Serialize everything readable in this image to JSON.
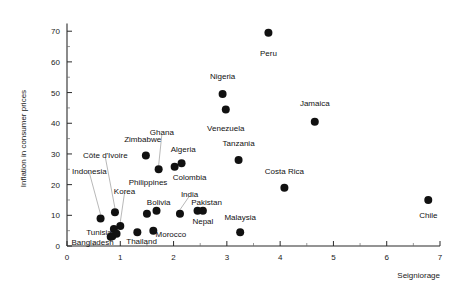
{
  "chart_data": {
    "type": "scatter",
    "title": "",
    "xlabel": "Seigniorage",
    "ylabel": "Inflation in consumer prices",
    "xlim": [
      0,
      7
    ],
    "ylim": [
      0,
      73
    ],
    "grid": false,
    "legend": "none",
    "xticks": [
      0,
      1,
      2,
      3,
      4,
      5,
      6,
      7
    ],
    "xtick_labels": [
      "0",
      "1",
      "2",
      "3",
      "4",
      "5",
      "6",
      "7"
    ],
    "yticks": [
      0,
      10,
      20,
      30,
      40,
      50,
      60,
      70
    ],
    "ytick_labels": [
      "0",
      "10",
      "20",
      "30",
      "40",
      "50",
      "60",
      "70"
    ],
    "marker": "filled-circle",
    "marker_color": "#111111",
    "points": [
      {
        "label": "Peru",
        "x": 3.78,
        "y": 69.5,
        "lx": 3.78,
        "ly": 63.0,
        "anchor": "middle",
        "leader": false
      },
      {
        "label": "Nigeria",
        "x": 2.92,
        "y": 49.5,
        "lx": 2.92,
        "ly": 55.5,
        "anchor": "middle",
        "leader": false
      },
      {
        "label": "Venezuela",
        "x": 2.98,
        "y": 44.5,
        "lx": 2.98,
        "ly": 38.5,
        "anchor": "middle",
        "leader": false
      },
      {
        "label": "Jamaica",
        "x": 4.65,
        "y": 40.5,
        "lx": 4.65,
        "ly": 46.5,
        "anchor": "middle",
        "leader": false
      },
      {
        "label": "Zimbabwe",
        "x": 1.48,
        "y": 29.5,
        "lx": 1.42,
        "ly": 35.0,
        "anchor": "middle",
        "leader": false
      },
      {
        "label": "Ghana",
        "x": 1.72,
        "y": 25.0,
        "lx": 1.78,
        "ly": 37.0,
        "anchor": "middle",
        "leader": true
      },
      {
        "label": "Algeria",
        "x": 2.02,
        "y": 25.8,
        "lx": 2.18,
        "ly": 31.5,
        "anchor": "middle",
        "leader": false
      },
      {
        "label": "Colombia",
        "x": 2.15,
        "y": 27.0,
        "lx": 2.3,
        "ly": 22.5,
        "anchor": "middle",
        "leader": false
      },
      {
        "label": "Tanzania",
        "x": 3.22,
        "y": 28.0,
        "lx": 3.22,
        "ly": 33.5,
        "anchor": "middle",
        "leader": false
      },
      {
        "label": "Côte d'Ivoire",
        "x": 0.9,
        "y": 11.0,
        "lx": 0.72,
        "ly": 29.5,
        "anchor": "middle",
        "leader": true
      },
      {
        "label": "Indonesia",
        "x": 0.63,
        "y": 9.0,
        "lx": 0.42,
        "ly": 24.5,
        "anchor": "middle",
        "leader": true
      },
      {
        "label": "Philippines",
        "x": 1.5,
        "y": 10.5,
        "lx": 1.52,
        "ly": 21.0,
        "anchor": "middle",
        "leader": false
      },
      {
        "label": "Korea",
        "x": 1.0,
        "y": 6.5,
        "lx": 1.08,
        "ly": 18.0,
        "anchor": "middle",
        "leader": true
      },
      {
        "label": "India",
        "x": 2.12,
        "y": 10.5,
        "lx": 2.3,
        "ly": 17.0,
        "anchor": "middle",
        "leader": true
      },
      {
        "label": "Bolivia",
        "x": 1.68,
        "y": 11.5,
        "lx": 1.72,
        "ly": 14.5,
        "anchor": "middle",
        "leader": false
      },
      {
        "label": "Pakistan",
        "x": 2.55,
        "y": 11.5,
        "lx": 2.62,
        "ly": 14.5,
        "anchor": "middle",
        "leader": false
      },
      {
        "label": "Nepal",
        "x": 2.45,
        "y": 11.5,
        "lx": 2.55,
        "ly": 8.0,
        "anchor": "middle",
        "leader": false
      },
      {
        "label": "Costa Rica",
        "x": 4.08,
        "y": 19.0,
        "lx": 4.08,
        "ly": 24.5,
        "anchor": "middle",
        "leader": false
      },
      {
        "label": "Chile",
        "x": 6.78,
        "y": 15.0,
        "lx": 6.78,
        "ly": 10.0,
        "anchor": "middle",
        "leader": false
      },
      {
        "label": "Malaysia",
        "x": 3.25,
        "y": 4.5,
        "lx": 3.25,
        "ly": 9.5,
        "anchor": "middle",
        "leader": false
      },
      {
        "label": "Morocco",
        "x": 1.62,
        "y": 5.0,
        "lx": 1.95,
        "ly": 4.0,
        "anchor": "middle",
        "leader": false
      },
      {
        "label": "Thailand",
        "x": 1.32,
        "y": 4.5,
        "lx": 1.4,
        "ly": 1.5,
        "anchor": "middle",
        "leader": false
      },
      {
        "label": "Tunisia",
        "x": 0.88,
        "y": 5.5,
        "lx": 0.6,
        "ly": 4.5,
        "anchor": "middle",
        "leader": false
      },
      {
        "label": "Bangladesh",
        "x": 0.85,
        "y": 3.2,
        "lx": 0.48,
        "ly": 1.3,
        "anchor": "middle",
        "leader": false
      }
    ],
    "extra_points": [
      {
        "x": 0.93,
        "y": 4.0
      },
      {
        "x": 0.82,
        "y": 3.0
      }
    ]
  }
}
